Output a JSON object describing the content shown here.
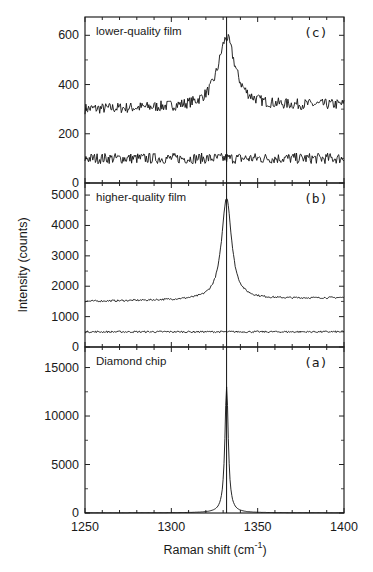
{
  "chart_data": {
    "type": "line",
    "layout": "three vertically stacked panels sharing x axis",
    "xlabel": "Raman shift (cm",
    "xlabel_sup": "-1",
    "xlabel_close": ")",
    "ylabel": "Intensity (counts)",
    "xlim": [
      1250,
      1400
    ],
    "x_ticks": [
      1250,
      1300,
      1350,
      1400
    ],
    "x_tick_labels": [
      "1250",
      "1300",
      "1350",
      "1400"
    ],
    "reference_line_x": 1332,
    "panels": [
      {
        "tag": "(c)",
        "title": "lower-quality film",
        "ylim": [
          0,
          650
        ],
        "y_ticks": [
          0,
          200,
          400,
          600
        ],
        "y_tick_labels": [
          "0",
          "200",
          "400",
          "600"
        ],
        "series": [
          {
            "name": "measured spectrum + fit",
            "baseline": 300,
            "peak_x": 1332,
            "peak_y": 580,
            "width": 6,
            "noise": 22,
            "slope": 0.12
          },
          {
            "name": "residual",
            "baseline": 100,
            "peak_x": 1332,
            "peak_y": 100,
            "width": 6,
            "noise": 22,
            "slope": 0
          }
        ]
      },
      {
        "tag": "(b)",
        "title": "higher-quality film",
        "ylim": [
          0,
          5200
        ],
        "y_ticks": [
          0,
          1000,
          2000,
          3000,
          4000,
          5000
        ],
        "y_tick_labels": [
          "0",
          "1000",
          "2000",
          "3000",
          "4000",
          "5000"
        ],
        "series": [
          {
            "name": "measured spectrum + fit",
            "baseline": 1500,
            "peak_x": 1332,
            "peak_y": 4850,
            "width": 3.5,
            "noise": 30,
            "slope": 0.8
          },
          {
            "name": "residual",
            "baseline": 500,
            "peak_x": 1332,
            "peak_y": 500,
            "width": 3,
            "noise": 30,
            "slope": 0
          }
        ]
      },
      {
        "tag": "(a)",
        "title": "Diamond chip",
        "ylim": [
          0,
          16500
        ],
        "y_ticks": [
          0,
          5000,
          10000,
          15000
        ],
        "y_tick_labels": [
          "0",
          "5000",
          "10000",
          "15000"
        ],
        "series": [
          {
            "name": "spectrum",
            "baseline": 20,
            "peak_x": 1332,
            "peak_y": 13000,
            "width": 1.2,
            "noise": 0,
            "slope": 0
          }
        ]
      }
    ],
    "grid": false,
    "legend": "none"
  },
  "style": {
    "line_color": "#111111",
    "axis_color": "#222222",
    "background": "#ffffff"
  }
}
